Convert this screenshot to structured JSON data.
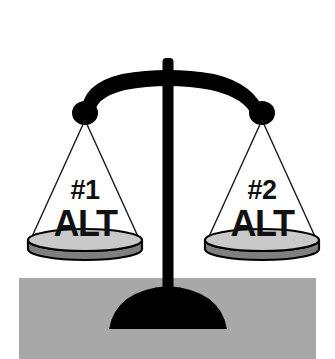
{
  "illustration": {
    "title": "balance-scale-comparison",
    "subject": "balance scale weighing two alternatives",
    "state": "balanced",
    "background_color": "#ffffff"
  },
  "ground": {
    "label": "ground",
    "color": "#a8a8a8",
    "x": 19,
    "y": 278,
    "width": 297,
    "height": 81
  },
  "base": {
    "label": "base",
    "color": "#000000",
    "center_x": 168,
    "top_y": 285,
    "width": 118,
    "height": 44
  },
  "post": {
    "label": "post",
    "color": "#000000",
    "center_x": 168,
    "top_y": 58,
    "bottom_y": 300,
    "width": 11
  },
  "beam": {
    "label": "beam",
    "color": "#000000",
    "left_x": 85,
    "right_x": 262,
    "apex_y": 76,
    "end_y": 113,
    "thickness": 15
  },
  "knobs": {
    "color": "#000000",
    "radius": 12,
    "left": {
      "x": 85,
      "y": 114
    },
    "right": {
      "x": 262,
      "y": 114
    }
  },
  "strings": {
    "color": "#1a1a1a",
    "width": 1.4
  },
  "pans": [
    {
      "id": "left-pan",
      "side": "left",
      "center_x": 85,
      "rim_y": 240,
      "radius_x": 57,
      "radius_y": 11,
      "depth": 16,
      "top_color": "#c9c9c9",
      "wall_color": "#7f7f7f",
      "outline_color": "#000000",
      "label_number": "#1",
      "label_word": "ALT",
      "number_y": 191,
      "word_y": 225
    },
    {
      "id": "right-pan",
      "side": "right",
      "center_x": 262,
      "rim_y": 240,
      "radius_x": 57,
      "radius_y": 11,
      "depth": 16,
      "top_color": "#c9c9c9",
      "wall_color": "#7f7f7f",
      "outline_color": "#000000",
      "label_number": "#2",
      "label_word": "ALT",
      "number_y": 191,
      "word_y": 225
    }
  ]
}
